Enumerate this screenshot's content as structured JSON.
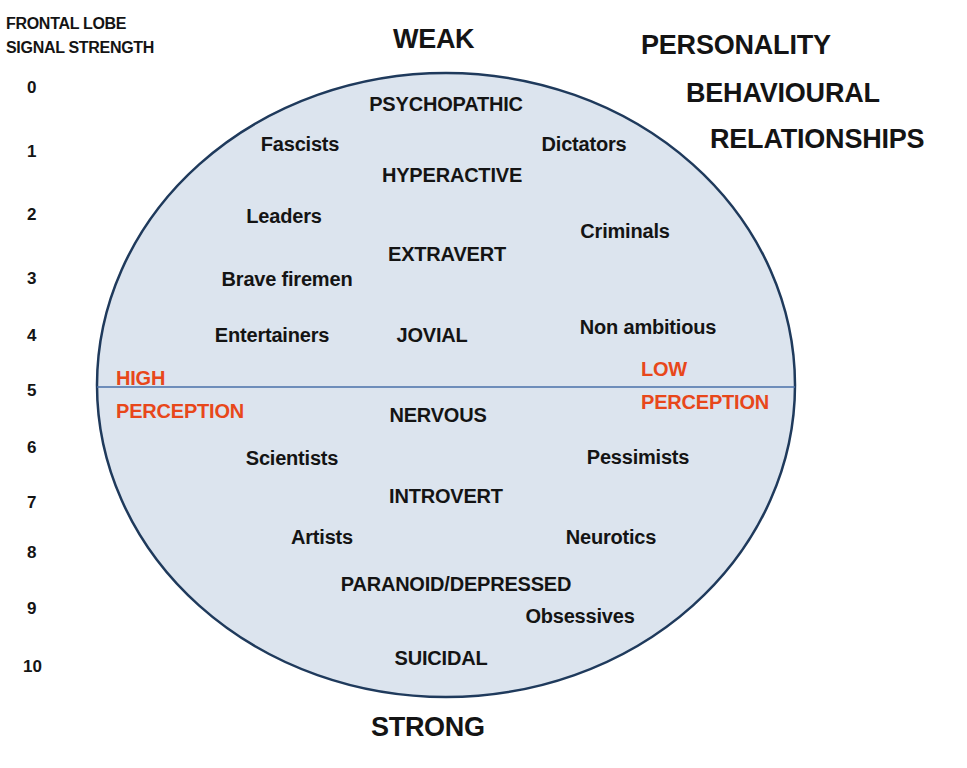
{
  "axis": {
    "title_line1": "FRONTAL LOBE",
    "title_line2": "SIGNAL STRENGTH",
    "ticks": [
      "0",
      "1",
      "2",
      "3",
      "4",
      "5",
      "6",
      "7",
      "8",
      "9",
      "10"
    ]
  },
  "top_label": "WEAK",
  "bottom_label": "STRONG",
  "title": {
    "line1": "PERSONALITY",
    "line2": "BEHAVIOURAL",
    "line3": "RELATIONSHIPS"
  },
  "perception": {
    "left_line1": "HIGH",
    "left_line2": "PERCEPTION",
    "right_line1": "LOW",
    "right_line2": "PERCEPTION"
  },
  "labels": {
    "psychopathic": "PSYCHOPATHIC",
    "fascists": "Fascists",
    "dictators": "Dictators",
    "hyperactive": "HYPERACTIVE",
    "leaders": "Leaders",
    "criminals": "Criminals",
    "extravert": "EXTRAVERT",
    "brave_firemen": "Brave firemen",
    "entertainers": "Entertainers",
    "jovial": "JOVIAL",
    "non_ambitious": "Non ambitious",
    "nervous": "NERVOUS",
    "scientists": "Scientists",
    "pessimists": "Pessimists",
    "introvert": "INTROVERT",
    "artists": "Artists",
    "neurotics": "Neurotics",
    "paranoid_depressed": "PARANOID/DEPRESSED",
    "obsessives": "Obsessives",
    "suicidal": "SUICIDAL"
  },
  "colors": {
    "ellipse_fill": "#dce4ee",
    "ellipse_stroke": "#1f3a5c",
    "divider": "#4a70a8",
    "perception_text": "#e8471a"
  }
}
